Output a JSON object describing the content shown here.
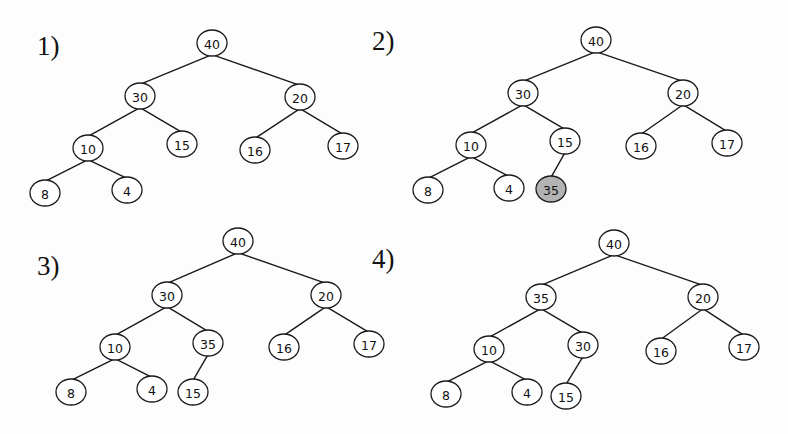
{
  "figure": {
    "width": 788,
    "height": 434,
    "background": "#fdfdfd",
    "node_stroke": "#1a1a1a",
    "node_fill": "#ffffff",
    "highlight_fill": "#b3b3b3",
    "node_rx": 15,
    "node_ry": 13
  },
  "panels": [
    {
      "label": "1)",
      "label_pos": [
        37,
        55
      ],
      "nodes": [
        {
          "id": "a",
          "value": "40",
          "x": 212,
          "y": 43
        },
        {
          "id": "b",
          "value": "30",
          "x": 140,
          "y": 96
        },
        {
          "id": "c",
          "value": "20",
          "x": 300,
          "y": 97
        },
        {
          "id": "d",
          "value": "10",
          "x": 88,
          "y": 148
        },
        {
          "id": "e",
          "value": "15",
          "x": 182,
          "y": 144
        },
        {
          "id": "f",
          "value": "16",
          "x": 255,
          "y": 150
        },
        {
          "id": "g",
          "value": "17",
          "x": 343,
          "y": 146
        },
        {
          "id": "h",
          "value": "8",
          "x": 45,
          "y": 193
        },
        {
          "id": "i",
          "value": "4",
          "x": 127,
          "y": 190
        }
      ],
      "edges": [
        [
          "a",
          "b"
        ],
        [
          "a",
          "c"
        ],
        [
          "b",
          "d"
        ],
        [
          "b",
          "e"
        ],
        [
          "c",
          "f"
        ],
        [
          "c",
          "g"
        ],
        [
          "d",
          "h"
        ],
        [
          "d",
          "i"
        ]
      ],
      "highlight": []
    },
    {
      "label": "2)",
      "label_pos": [
        372,
        50
      ],
      "nodes": [
        {
          "id": "a",
          "value": "40",
          "x": 596,
          "y": 40
        },
        {
          "id": "b",
          "value": "30",
          "x": 523,
          "y": 93
        },
        {
          "id": "c",
          "value": "20",
          "x": 683,
          "y": 93
        },
        {
          "id": "d",
          "value": "10",
          "x": 471,
          "y": 145
        },
        {
          "id": "e",
          "value": "15",
          "x": 565,
          "y": 141
        },
        {
          "id": "f",
          "value": "16",
          "x": 641,
          "y": 146
        },
        {
          "id": "g",
          "value": "17",
          "x": 727,
          "y": 143
        },
        {
          "id": "h",
          "value": "8",
          "x": 428,
          "y": 190
        },
        {
          "id": "i",
          "value": "4",
          "x": 509,
          "y": 188
        },
        {
          "id": "j",
          "value": "35",
          "x": 551,
          "y": 189
        }
      ],
      "edges": [
        [
          "a",
          "b"
        ],
        [
          "a",
          "c"
        ],
        [
          "b",
          "d"
        ],
        [
          "b",
          "e"
        ],
        [
          "c",
          "f"
        ],
        [
          "c",
          "g"
        ],
        [
          "d",
          "h"
        ],
        [
          "d",
          "i"
        ],
        [
          "e",
          "j"
        ]
      ],
      "highlight": [
        "j"
      ]
    },
    {
      "label": "3)",
      "label_pos": [
        37,
        275
      ],
      "nodes": [
        {
          "id": "a",
          "value": "40",
          "x": 238,
          "y": 241
        },
        {
          "id": "b",
          "value": "30",
          "x": 167,
          "y": 295
        },
        {
          "id": "c",
          "value": "20",
          "x": 326,
          "y": 295
        },
        {
          "id": "d",
          "value": "10",
          "x": 115,
          "y": 347
        },
        {
          "id": "e",
          "value": "35",
          "x": 208,
          "y": 343
        },
        {
          "id": "f",
          "value": "16",
          "x": 284,
          "y": 347
        },
        {
          "id": "g",
          "value": "17",
          "x": 369,
          "y": 344
        },
        {
          "id": "h",
          "value": "8",
          "x": 71,
          "y": 392
        },
        {
          "id": "i",
          "value": "4",
          "x": 152,
          "y": 389
        },
        {
          "id": "j",
          "value": "15",
          "x": 193,
          "y": 392
        }
      ],
      "edges": [
        [
          "a",
          "b"
        ],
        [
          "a",
          "c"
        ],
        [
          "b",
          "d"
        ],
        [
          "b",
          "e"
        ],
        [
          "c",
          "f"
        ],
        [
          "c",
          "g"
        ],
        [
          "d",
          "h"
        ],
        [
          "d",
          "i"
        ],
        [
          "e",
          "j"
        ]
      ],
      "highlight": []
    },
    {
      "label": "4)",
      "label_pos": [
        372,
        268
      ],
      "nodes": [
        {
          "id": "a",
          "value": "40",
          "x": 614,
          "y": 243
        },
        {
          "id": "b",
          "value": "35",
          "x": 541,
          "y": 297
        },
        {
          "id": "c",
          "value": "20",
          "x": 703,
          "y": 297
        },
        {
          "id": "d",
          "value": "10",
          "x": 489,
          "y": 349
        },
        {
          "id": "e",
          "value": "30",
          "x": 583,
          "y": 345
        },
        {
          "id": "f",
          "value": "16",
          "x": 661,
          "y": 351
        },
        {
          "id": "g",
          "value": "17",
          "x": 744,
          "y": 347
        },
        {
          "id": "h",
          "value": "8",
          "x": 446,
          "y": 394
        },
        {
          "id": "i",
          "value": "4",
          "x": 527,
          "y": 392
        },
        {
          "id": "j",
          "value": "15",
          "x": 566,
          "y": 396
        }
      ],
      "edges": [
        [
          "a",
          "b"
        ],
        [
          "a",
          "c"
        ],
        [
          "b",
          "d"
        ],
        [
          "b",
          "e"
        ],
        [
          "c",
          "f"
        ],
        [
          "c",
          "g"
        ],
        [
          "d",
          "h"
        ],
        [
          "d",
          "i"
        ],
        [
          "e",
          "j"
        ]
      ],
      "highlight": []
    }
  ]
}
